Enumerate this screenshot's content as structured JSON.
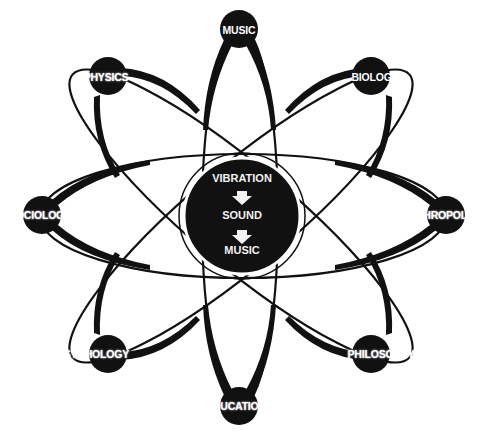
{
  "diagram": {
    "type": "atom-concept-map",
    "colors": {
      "ink": "#111111",
      "background": "#ffffff",
      "label_on_dark": "#ffffff"
    },
    "center": {
      "lines": [
        "VIBRATION",
        "SOUND",
        "MUSIC"
      ],
      "arrows": [
        "down-arrow",
        "down-arrow"
      ]
    },
    "nodes": [
      {
        "id": "music",
        "label": "MUSIC"
      },
      {
        "id": "biology",
        "label": "BIOLOGY"
      },
      {
        "id": "anthropology",
        "label": "ANTHROPOLOGY"
      },
      {
        "id": "philosophy",
        "label": "PHILOSOPHY"
      },
      {
        "id": "education",
        "label": "EDUCATION"
      },
      {
        "id": "psychology",
        "label": "PSYCHOLOGY"
      },
      {
        "id": "sociology",
        "label": "SOCIOLOGY"
      },
      {
        "id": "physics",
        "label": "PHYSICS"
      }
    ]
  }
}
